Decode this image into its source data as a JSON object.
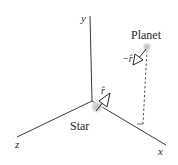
{
  "diagram": {
    "axes": {
      "x_label": "x",
      "y_label": "y",
      "z_label": "z"
    },
    "bodies": {
      "star_label": "Star",
      "planet_label": "Planet"
    },
    "vectors": {
      "r_hat_label": "r̂",
      "neg_r_hat_label": "−r̂"
    },
    "colors": {
      "axis": "#3a3a3a",
      "body_fill": "#c8c8c8",
      "body_glow": "#e6e6e6",
      "arrow_fill": "#ffffff",
      "arrow_stroke": "#222222",
      "dashed": "#444444"
    }
  }
}
